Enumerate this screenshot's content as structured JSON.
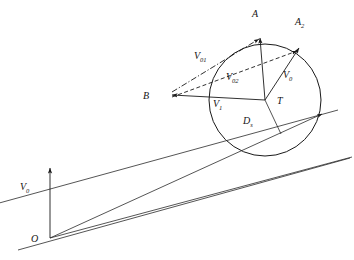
{
  "figure": {
    "type": "vector-kinematics-diagram",
    "background_color": "#ffffff",
    "line_color": "#1a1a1a",
    "width": 354,
    "height": 260
  },
  "labels": {
    "origin": "O",
    "target": "T",
    "point_a": "A",
    "point_a2": "A",
    "point_a2_sub": "2",
    "point_b": "B",
    "v0_origin": "V",
    "v0_origin_sub": "0",
    "v0_target": "V",
    "v0_target_sub": "0",
    "v01": "V",
    "v01_sub": "01",
    "v02": "V",
    "v02_sub": "02",
    "v1": "V",
    "v1_sub": "1",
    "d": "D",
    "d_sub": "s"
  },
  "geometry": {
    "circle": {
      "cx": 265,
      "cy": 100,
      "r": 56
    },
    "origin_point": {
      "x": 50,
      "y": 238
    },
    "target_point": {
      "x": 265,
      "y": 100
    },
    "point_a": {
      "x": 259,
      "y": 33
    },
    "point_a2": {
      "x": 300,
      "y": 46
    },
    "point_b": {
      "x": 168,
      "y": 95
    },
    "v0_origin_arrow": {
      "x1": 50,
      "y1": 238,
      "x2": 50,
      "y2": 168
    },
    "ray_upper_end": {
      "x": 318,
      "y": 113
    },
    "ray_lower_end": {
      "x": 332,
      "y": 122
    }
  },
  "lines": {
    "v01_style": "dash-dot",
    "v02_style": "dashed",
    "v1_style": "solid",
    "v0_style": "solid",
    "band_style": "solid-parallel"
  }
}
